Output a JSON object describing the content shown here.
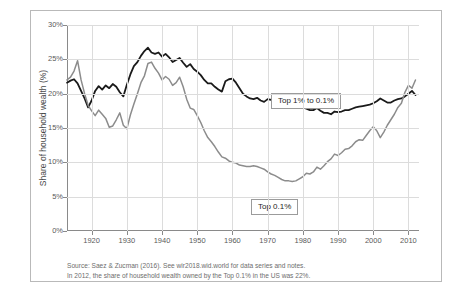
{
  "chart_data": {
    "type": "line",
    "title": "",
    "xlabel": "",
    "ylabel": "Share of household wealth (%)",
    "xlim": [
      1913,
      2013
    ],
    "ylim": [
      0,
      30
    ],
    "y_ticks": [
      "0%",
      "5%",
      "10%",
      "15%",
      "20%",
      "25%",
      "30%"
    ],
    "y_tick_values": [
      0,
      5,
      10,
      15,
      20,
      25,
      30
    ],
    "x_ticks": [
      "1920",
      "1930",
      "1940",
      "1950",
      "1960",
      "1970",
      "1980",
      "1990",
      "2000",
      "2010"
    ],
    "x_tick_values": [
      1920,
      1930,
      1940,
      1950,
      1960,
      1970,
      1980,
      1990,
      2000,
      2010
    ],
    "grid": true,
    "legend_position": "inline-callouts",
    "series": [
      {
        "name": "Top 1% to 0.1%",
        "color": "#1a1a1a",
        "x": [
          1913,
          1914,
          1915,
          1916,
          1917,
          1918,
          1919,
          1920,
          1921,
          1922,
          1923,
          1924,
          1925,
          1926,
          1927,
          1928,
          1929,
          1930,
          1931,
          1932,
          1933,
          1934,
          1935,
          1936,
          1937,
          1938,
          1939,
          1940,
          1941,
          1942,
          1943,
          1944,
          1945,
          1946,
          1947,
          1948,
          1949,
          1950,
          1951,
          1952,
          1953,
          1954,
          1955,
          1956,
          1957,
          1958,
          1959,
          1960,
          1961,
          1962,
          1963,
          1964,
          1965,
          1966,
          1967,
          1968,
          1969,
          1970,
          1971,
          1972,
          1973,
          1974,
          1975,
          1976,
          1977,
          1978,
          1979,
          1980,
          1981,
          1982,
          1983,
          1984,
          1985,
          1986,
          1987,
          1988,
          1989,
          1990,
          1991,
          1992,
          1993,
          1994,
          1995,
          1996,
          1997,
          1998,
          1999,
          2000,
          2001,
          2002,
          2003,
          2004,
          2005,
          2006,
          2007,
          2008,
          2009,
          2010,
          2011,
          2012
        ],
        "y": [
          21.6,
          21.9,
          22.1,
          21.5,
          20.4,
          19.3,
          18.0,
          19.0,
          20.4,
          21.1,
          20.6,
          21.2,
          20.8,
          21.4,
          21.0,
          20.2,
          19.6,
          21.3,
          22.8,
          24.0,
          24.6,
          25.5,
          26.2,
          26.7,
          26.0,
          25.8,
          26.0,
          25.4,
          25.8,
          25.3,
          24.6,
          24.9,
          25.2,
          24.5,
          23.9,
          24.3,
          23.6,
          23.2,
          22.7,
          22.0,
          21.5,
          21.5,
          21.0,
          20.6,
          20.3,
          21.8,
          22.1,
          22.2,
          21.6,
          20.8,
          20.0,
          19.6,
          19.3,
          19.2,
          19.4,
          19.0,
          18.8,
          19.2,
          19.1,
          19.0,
          18.8,
          18.5,
          18.5,
          18.7,
          18.6,
          18.4,
          18.2,
          18.0,
          17.8,
          17.6,
          17.6,
          17.9,
          17.5,
          17.2,
          17.2,
          17.0,
          17.4,
          17.3,
          17.4,
          17.6,
          17.6,
          17.8,
          18.0,
          18.1,
          18.2,
          18.3,
          18.4,
          18.6,
          18.9,
          19.3,
          19.0,
          18.7,
          18.7,
          19.0,
          19.2,
          19.3,
          19.6,
          20.0,
          20.4,
          19.8
        ]
      },
      {
        "name": "Top 0.1%",
        "color": "#8c8c8c",
        "x": [
          1913,
          1914,
          1915,
          1916,
          1917,
          1918,
          1919,
          1920,
          1921,
          1922,
          1923,
          1924,
          1925,
          1926,
          1927,
          1928,
          1929,
          1930,
          1931,
          1932,
          1933,
          1934,
          1935,
          1936,
          1937,
          1938,
          1939,
          1940,
          1941,
          1942,
          1943,
          1944,
          1945,
          1946,
          1947,
          1948,
          1949,
          1950,
          1951,
          1952,
          1953,
          1954,
          1955,
          1956,
          1957,
          1958,
          1959,
          1960,
          1961,
          1962,
          1963,
          1964,
          1965,
          1966,
          1967,
          1968,
          1969,
          1970,
          1971,
          1972,
          1973,
          1974,
          1975,
          1976,
          1977,
          1978,
          1979,
          1980,
          1981,
          1982,
          1983,
          1984,
          1985,
          1986,
          1987,
          1988,
          1989,
          1990,
          1991,
          1992,
          1993,
          1994,
          1995,
          1996,
          1997,
          1998,
          1999,
          2000,
          2001,
          2002,
          2003,
          2004,
          2005,
          2006,
          2007,
          2008,
          2009,
          2010,
          2011,
          2012
        ],
        "y": [
          22.0,
          22.4,
          23.3,
          24.8,
          22.0,
          20.0,
          18.3,
          17.5,
          16.8,
          17.6,
          17.0,
          16.4,
          15.1,
          15.3,
          16.2,
          17.2,
          15.4,
          14.9,
          16.9,
          18.5,
          20.0,
          21.6,
          22.6,
          24.4,
          24.6,
          23.7,
          23.0,
          22.0,
          22.5,
          22.1,
          21.2,
          21.6,
          22.4,
          21.0,
          19.2,
          17.9,
          17.7,
          16.8,
          15.8,
          14.6,
          13.6,
          13.0,
          12.3,
          11.5,
          10.8,
          10.6,
          10.2,
          10.0,
          9.9,
          9.6,
          9.5,
          9.4,
          9.4,
          9.5,
          9.4,
          9.2,
          9.0,
          8.6,
          8.3,
          8.1,
          7.8,
          7.5,
          7.3,
          7.3,
          7.2,
          7.3,
          7.6,
          7.9,
          8.4,
          8.3,
          8.6,
          9.3,
          9.0,
          9.5,
          10.1,
          10.5,
          11.2,
          11.0,
          11.4,
          11.9,
          12.0,
          12.4,
          13.0,
          13.3,
          13.2,
          13.9,
          14.6,
          15.2,
          14.6,
          13.6,
          14.4,
          15.4,
          16.2,
          17.0,
          18.0,
          18.6,
          20.2,
          21.2,
          20.8,
          22.0
        ]
      }
    ],
    "callouts": [
      {
        "id": "top1",
        "label": "Top 1% to 0.1%"
      },
      {
        "id": "top01",
        "label": "Top 0.1%"
      }
    ]
  },
  "source_note": {
    "line1": "Source: Saez & Zucman (2016). See wir2018.wid.world for data series and notes.",
    "line2": "In 2012, the share of household wealth owned by the Top 0.1% in the US was 22%."
  },
  "caption": {
    "text": ""
  }
}
